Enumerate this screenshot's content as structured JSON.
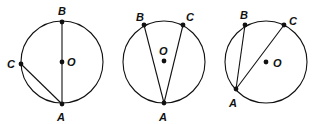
{
  "figure": {
    "colors": {
      "stroke": "#111111",
      "background": "#ffffff"
    },
    "circles": [
      {
        "cx": 62,
        "cy": 62,
        "r": 41,
        "center": {
          "label": "O",
          "x": 62,
          "y": 62,
          "lx": 67,
          "ly": 66
        },
        "points": [
          {
            "label": "B",
            "x": 62,
            "y": 22,
            "lx": 58,
            "ly": 15
          },
          {
            "label": "C",
            "x": 21,
            "y": 64,
            "lx": 7,
            "ly": 68
          },
          {
            "label": "A",
            "x": 62,
            "y": 104,
            "lx": 57,
            "ly": 121
          }
        ],
        "segments": [
          [
            "A",
            "B"
          ],
          [
            "A",
            "C"
          ]
        ]
      },
      {
        "cx": 164,
        "cy": 62,
        "r": 41,
        "center": {
          "label": "O",
          "x": 164,
          "y": 61,
          "lx": 159,
          "ly": 55
        },
        "points": [
          {
            "label": "B",
            "x": 144,
            "y": 25,
            "lx": 136,
            "ly": 21
          },
          {
            "label": "C",
            "x": 183,
            "y": 25,
            "lx": 186,
            "ly": 21
          },
          {
            "label": "A",
            "x": 164,
            "y": 103,
            "lx": 159,
            "ly": 121
          }
        ],
        "segments": [
          [
            "A",
            "B"
          ],
          [
            "A",
            "C"
          ]
        ]
      },
      {
        "cx": 266,
        "cy": 62,
        "r": 41,
        "center": {
          "label": "O",
          "x": 266,
          "y": 62,
          "lx": 273,
          "ly": 67
        },
        "points": [
          {
            "label": "B",
            "x": 245,
            "y": 25,
            "lx": 240,
            "ly": 19
          },
          {
            "label": "C",
            "x": 284,
            "y": 25,
            "lx": 289,
            "ly": 25
          },
          {
            "label": "A",
            "x": 236,
            "y": 89,
            "lx": 229,
            "ly": 107
          }
        ],
        "segments": [
          [
            "A",
            "B"
          ],
          [
            "A",
            "C"
          ]
        ]
      }
    ]
  }
}
